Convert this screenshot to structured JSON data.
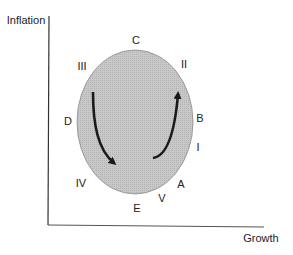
{
  "diagram": {
    "type": "business-cycle ellipse",
    "axes": {
      "y_label": "Inflation",
      "x_label": "Growth"
    },
    "ellipse": {
      "fill": "#c4c4c4",
      "stroke": "#8a8a8a",
      "cx": 135,
      "cy": 122,
      "rx": 58,
      "ry": 72
    },
    "letter_labels": [
      {
        "text": "A",
        "x": 181,
        "y": 184
      },
      {
        "text": "B",
        "x": 200,
        "y": 118
      },
      {
        "text": "C",
        "x": 136,
        "y": 40
      },
      {
        "text": "D",
        "x": 68,
        "y": 121
      },
      {
        "text": "E",
        "x": 137,
        "y": 208
      }
    ],
    "phase_labels": [
      {
        "text": "I",
        "x": 198,
        "y": 147
      },
      {
        "text": "II",
        "x": 184,
        "y": 64
      },
      {
        "text": "III",
        "x": 82,
        "y": 66
      },
      {
        "text": "IV",
        "x": 81,
        "y": 183
      },
      {
        "text": "V",
        "x": 162,
        "y": 198
      }
    ],
    "arrows": [
      {
        "name": "downward-arrow",
        "direction": "down-right",
        "from": [
          93,
          92
        ],
        "to": [
          114,
          163
        ]
      },
      {
        "name": "upward-arrow",
        "direction": "up-right",
        "from": [
          153,
          158
        ],
        "to": [
          178,
          94
        ]
      }
    ],
    "colors": {
      "axis": "#333333",
      "arrow": "#1a1a1a",
      "text": "#222222"
    }
  }
}
